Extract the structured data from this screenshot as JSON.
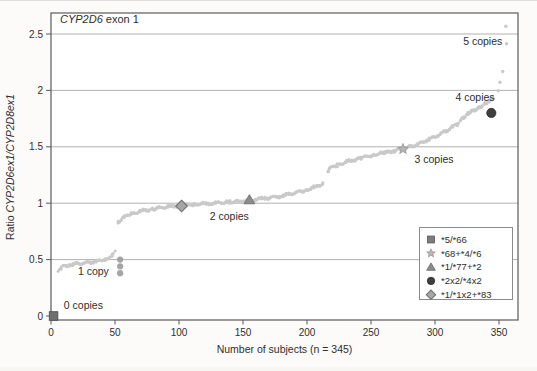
{
  "figure": {
    "kind": "scanned scientific scatter plot",
    "background": "#fcfbf9"
  },
  "chart_data": {
    "type": "scatter",
    "title_parts": [
      {
        "text": "CYP2D6",
        "italic": true
      },
      {
        "text": " exon 1",
        "italic": false
      }
    ],
    "xlabel": "Number of subjects (n = 345)",
    "ylabel_parts": [
      {
        "text": "Ratio ",
        "italic": false
      },
      {
        "text": "CYP2D6ex1/CYP2D8ex1",
        "italic": true
      }
    ],
    "xlim": [
      0,
      365
    ],
    "ylim": [
      -0.05,
      2.68
    ],
    "xticks": [
      0,
      50,
      100,
      150,
      200,
      250,
      300,
      350
    ],
    "yticks": [
      0,
      0.5,
      1,
      1.5,
      2,
      2.5
    ],
    "ytick_labels": [
      "0",
      "0.5",
      "1",
      "1.5",
      "2",
      "2.5"
    ],
    "grid": "horizontal only",
    "colors": {
      "series": "#c9c9c9",
      "grid": "#a8a8a8",
      "spine": "#5a5a5a",
      "text": "#2e2e2e"
    },
    "groups": [
      {
        "name": "0 copies",
        "anchors": [
          [
            0.5,
            0.0
          ],
          [
            4.5,
            0.0
          ]
        ]
      },
      {
        "name": "1 copy",
        "anchors": [
          [
            6,
            0.41
          ],
          [
            9,
            0.44
          ],
          [
            14,
            0.455
          ],
          [
            22,
            0.465
          ],
          [
            30,
            0.475
          ],
          [
            38,
            0.49
          ],
          [
            44,
            0.51
          ],
          [
            48,
            0.54
          ],
          [
            50,
            0.57
          ]
        ]
      },
      {
        "name": "2 copies",
        "anchors": [
          [
            52,
            0.83
          ],
          [
            56,
            0.87
          ],
          [
            62,
            0.9
          ],
          [
            70,
            0.93
          ],
          [
            80,
            0.95
          ],
          [
            92,
            0.97
          ],
          [
            102,
            0.98
          ],
          [
            112,
            0.99
          ],
          [
            125,
            1.0
          ],
          [
            140,
            1.01
          ],
          [
            152,
            1.02
          ],
          [
            165,
            1.04
          ],
          [
            178,
            1.06
          ],
          [
            190,
            1.09
          ],
          [
            200,
            1.12
          ],
          [
            208,
            1.15
          ],
          [
            213,
            1.18
          ]
        ]
      },
      {
        "name": "3-4 copies ramp",
        "anchors": [
          [
            216,
            1.27
          ],
          [
            218,
            1.31
          ],
          [
            224,
            1.34
          ],
          [
            232,
            1.37
          ],
          [
            242,
            1.4
          ],
          [
            252,
            1.43
          ],
          [
            262,
            1.45
          ],
          [
            270,
            1.47
          ],
          [
            278,
            1.49
          ],
          [
            286,
            1.52
          ],
          [
            294,
            1.56
          ],
          [
            302,
            1.6
          ],
          [
            310,
            1.65
          ],
          [
            317,
            1.7
          ],
          [
            323,
            1.76
          ],
          [
            328,
            1.81
          ],
          [
            334,
            1.85
          ],
          [
            340,
            1.89
          ],
          [
            346,
            1.93
          ]
        ],
        "singles": [
          [
            349,
            2.0
          ],
          [
            351,
            2.07
          ],
          [
            353,
            2.17
          ]
        ]
      },
      {
        "name": "5 copies",
        "anchors": [],
        "singles": [
          [
            355,
            2.57
          ],
          [
            356,
            2.42
          ]
        ]
      }
    ],
    "outlier_cluster": {
      "x": 54,
      "ys": [
        0.38,
        0.44,
        0.5
      ],
      "color": "#9b9b9b"
    },
    "special_points": [
      {
        "label": "*5/*66",
        "marker": "square",
        "fill": "#6f6f6f",
        "stroke": "#4a4a4a",
        "x": 2,
        "y": 0.0,
        "group": "0 copies"
      },
      {
        "label": "*68+*4/*6",
        "marker": "star",
        "fill": "#b5b5b5",
        "stroke": "#8f8f8f",
        "x": 275,
        "y": 1.48,
        "group": "3 copies"
      },
      {
        "label": "*1/*77+*2",
        "marker": "triangle",
        "fill": "#8c8c8c",
        "stroke": "#6a6a6a",
        "x": 155,
        "y": 1.03,
        "group": "2 copies"
      },
      {
        "label": "*2x2/*4x2",
        "marker": "circle",
        "fill": "#3f3f3f",
        "stroke": "#2a2a2a",
        "x": 344,
        "y": 1.8,
        "group": "4 copies"
      },
      {
        "label": "*1/*1x2+*83",
        "marker": "diamond",
        "fill": "#a5a5a5",
        "stroke": "#6f6f6f",
        "x": 102,
        "y": 0.975,
        "group": "2 copies"
      }
    ],
    "annotations": [
      {
        "text": "0 copies",
        "x": 10,
        "y": 0.06
      },
      {
        "text": "1 copy",
        "x": 21,
        "y": 0.36
      },
      {
        "text": "2 copies",
        "x": 124,
        "y": 0.85
      },
      {
        "text": "3 copies",
        "x": 284,
        "y": 1.36
      },
      {
        "text": "4 copies",
        "x": 316,
        "y": 1.91
      },
      {
        "text": "5 copies",
        "x": 322,
        "y": 2.4
      }
    ],
    "legend": {
      "position": "lower right",
      "entries": [
        {
          "label": "*5/*66",
          "marker": "square",
          "fill": "#7d7d7d",
          "stroke": "#565656"
        },
        {
          "label": "*68+*4/*6",
          "marker": "star",
          "fill": "#b8b8b8",
          "stroke": "#8f8f8f"
        },
        {
          "label": "*1/*77+*2",
          "marker": "triangle",
          "fill": "#8c8c8c",
          "stroke": "#6a6a6a"
        },
        {
          "label": "*2x2/*4x2",
          "marker": "circle",
          "fill": "#3f3f3f",
          "stroke": "#2a2a2a"
        },
        {
          "label": "*1/*1x2+*83",
          "marker": "diamond",
          "fill": "#a8a8a8",
          "stroke": "#6f6f6f"
        }
      ]
    }
  }
}
